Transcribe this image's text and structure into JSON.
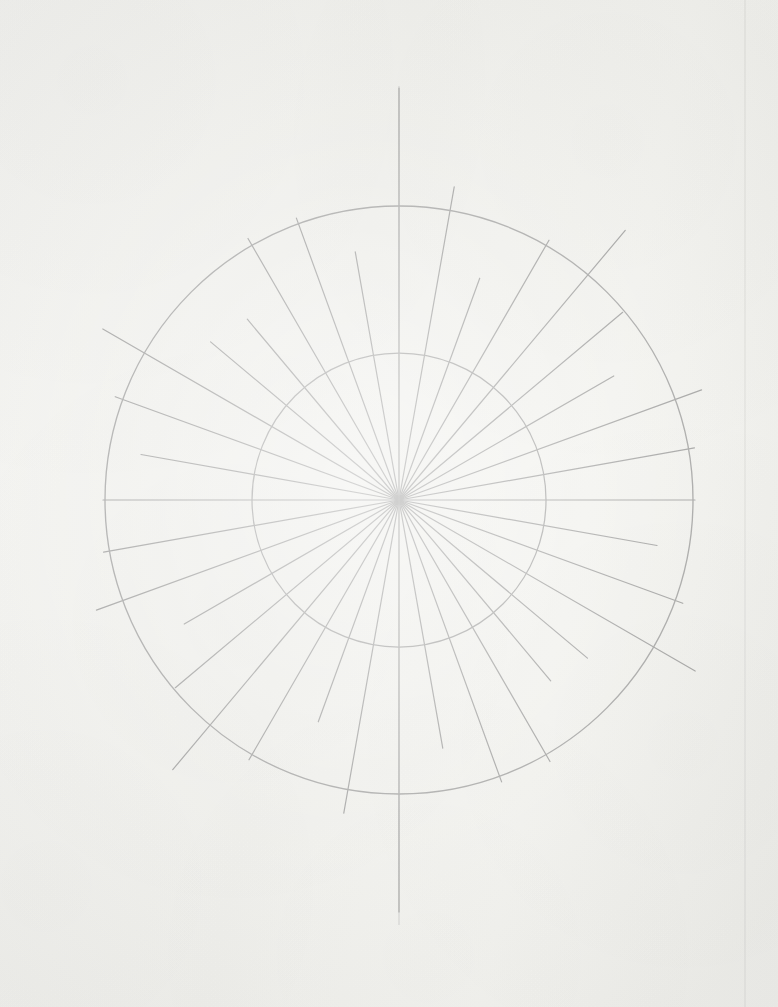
{
  "document": {
    "kind": "scanned-paper-figure",
    "title": "",
    "caption": "",
    "page_background_color": "#f8f8f6",
    "ink_color": "#a9a9a9"
  },
  "artifacts": {
    "right_margin_line": {
      "name": "scan-edge-line",
      "x": 745,
      "y_start": 0,
      "y_end": 1007,
      "color": "#eaeae8"
    },
    "crease_line": {
      "name": "paper-crease",
      "x": 399,
      "y_start": 86,
      "y_end": 925,
      "color": "#bcbcbc"
    }
  },
  "chart_data": {
    "type": "line",
    "title": "",
    "subtitle": "",
    "xlabel": "",
    "ylabel": "",
    "legend": [],
    "annotations": [],
    "grid": true,
    "legend_position": "none",
    "projection": "polar",
    "center": {
      "x": 399,
      "y": 500
    },
    "rings": [
      {
        "label": "inner-ring",
        "radius": 147,
        "stroke": "#adadad",
        "width": 1.25
      },
      {
        "label": "outer-ring",
        "radius": 294,
        "stroke": "#adadad",
        "width": 1.35
      }
    ],
    "rlim": [
      0,
      294
    ],
    "angle_unit": "degrees",
    "angle_step": 10,
    "spoke_stroke": "#a9a9a9",
    "spoke_width": 1.2,
    "categories": [
      "0",
      "10",
      "20",
      "30",
      "40",
      "50",
      "60",
      "70",
      "80",
      "90",
      "100",
      "110",
      "120",
      "130",
      "140",
      "150",
      "160",
      "170",
      "180",
      "190",
      "200",
      "210",
      "220",
      "230",
      "240",
      "250",
      "260",
      "270",
      "280",
      "290",
      "300",
      "310",
      "320",
      "330",
      "340",
      "350"
    ],
    "values": [
      412,
      318,
      236,
      300,
      352,
      292,
      248,
      322,
      300,
      296,
      262,
      302,
      342,
      246,
      236,
      302,
      300,
      252,
      412,
      318,
      236,
      300,
      352,
      292,
      248,
      322,
      300,
      296,
      262,
      302,
      342,
      246,
      236,
      302,
      300,
      252
    ],
    "series": [
      {
        "name": "ray-length",
        "values": [
          412,
          318,
          236,
          300,
          352,
          292,
          248,
          322,
          300,
          296,
          262,
          302,
          342,
          246,
          236,
          302,
          300,
          252,
          412,
          318,
          236,
          300,
          352,
          292,
          248,
          322,
          300,
          296,
          262,
          302,
          342,
          246,
          236,
          302,
          300,
          252
        ]
      }
    ]
  }
}
